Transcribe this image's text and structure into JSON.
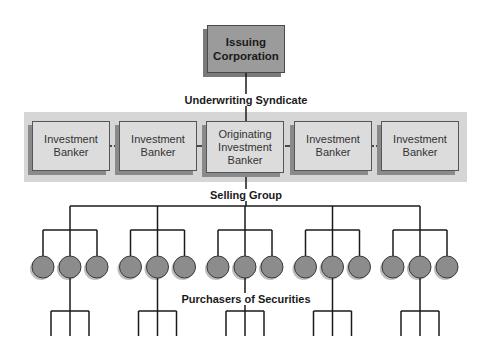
{
  "diagram": {
    "issuer": {
      "label_line1": "Issuing",
      "label_line2": "Corporation"
    },
    "underwriting_label": "Underwriting Syndicate",
    "bankers": [
      {
        "line1": "Investment",
        "line2": "Banker",
        "line3": ""
      },
      {
        "line1": "Investment",
        "line2": "Banker",
        "line3": ""
      },
      {
        "line1": "Originating",
        "line2": "Investment",
        "line3": "Banker"
      },
      {
        "line1": "Investment",
        "line2": "Banker",
        "line3": ""
      },
      {
        "line1": "Investment",
        "line2": "Banker",
        "line3": ""
      }
    ],
    "banker_connections": [
      "dotted",
      "solid",
      "solid",
      "dotted"
    ],
    "selling_group_label": "Selling Group",
    "selling_groups": 5,
    "dealers_per_group": 3,
    "purchasers_label": "Purchasers of Securities",
    "purchasers_per_group": 3
  }
}
